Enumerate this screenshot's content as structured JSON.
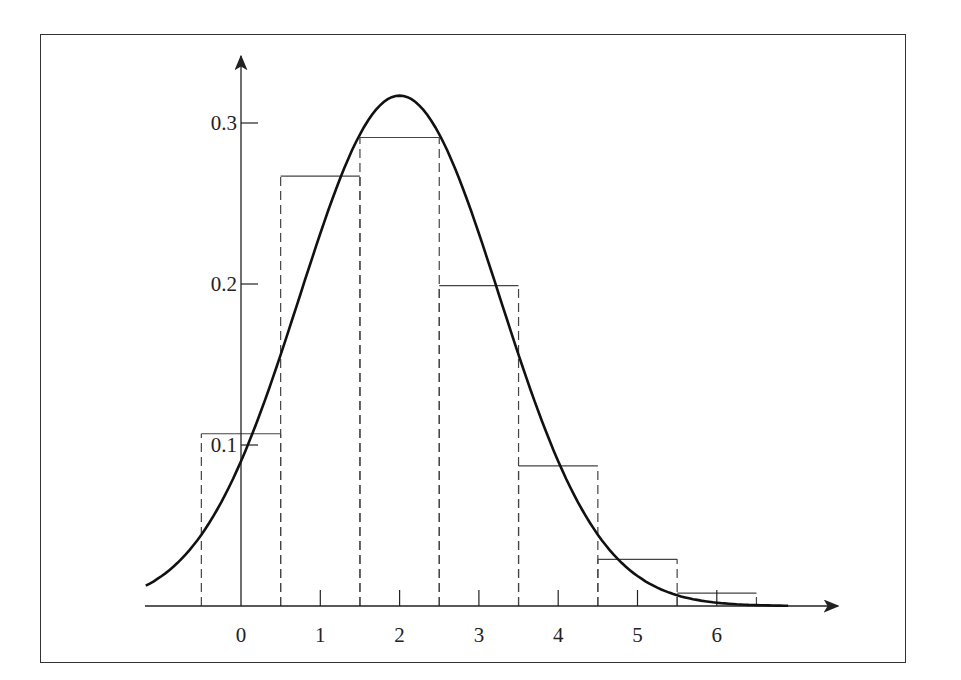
{
  "chart_data": {
    "type": "bar",
    "title": "",
    "xlabel": "",
    "ylabel": "",
    "categories": [
      "0",
      "1",
      "2",
      "3",
      "4",
      "5",
      "6"
    ],
    "bins": [
      [
        -0.5,
        0.5
      ],
      [
        0.5,
        1.5
      ],
      [
        1.5,
        2.5
      ],
      [
        2.5,
        3.5
      ],
      [
        3.5,
        4.5
      ],
      [
        4.5,
        5.5
      ],
      [
        5.5,
        6.5
      ]
    ],
    "series": [
      {
        "name": "histogram",
        "style": "bars, solid tops, dashed sides",
        "values": [
          0.107,
          0.267,
          0.291,
          0.199,
          0.087,
          0.029,
          0.008
        ]
      },
      {
        "name": "normal curve",
        "style": "thick solid line",
        "mean": 2,
        "sd": 1.26,
        "peak": 0.317
      }
    ],
    "x_ticks": [
      0,
      1,
      2,
      3,
      4,
      5,
      6
    ],
    "x_tick_labels": [
      "0",
      "1",
      "2",
      "3",
      "4",
      "5",
      "6"
    ],
    "y_ticks": [
      0.1,
      0.2,
      0.3
    ],
    "y_tick_labels": [
      "0.1",
      "0.2",
      "0.3"
    ],
    "xlim": [
      -1.2,
      7.5
    ],
    "ylim": [
      0,
      0.34
    ],
    "grid": false,
    "legend": "none",
    "colors": {
      "line": "#111111",
      "bars": "#444444",
      "frame": "#333333"
    }
  }
}
